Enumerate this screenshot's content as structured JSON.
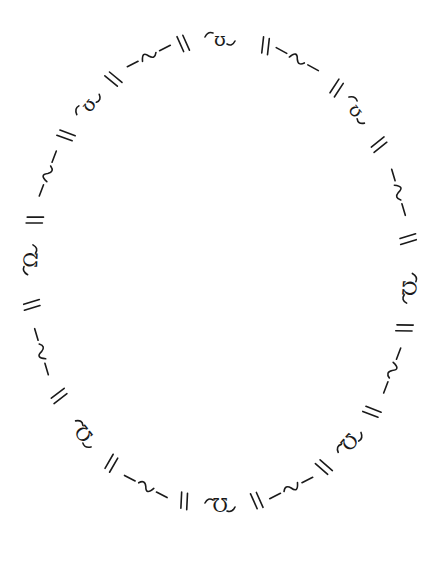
{
  "drawing": {
    "description": "Hand-drawn oval border made of repeating decorative motifs on white paper",
    "background": "#ffffff",
    "ink": "#1a1a1a",
    "ellipse": {
      "cx": 220,
      "cy": 272,
      "rx": 190,
      "ry": 233
    },
    "motif_sequence_clockwise_from_top": [
      {
        "angle": -90,
        "type": "glyph",
        "char": "ʊ"
      },
      {
        "angle": -76,
        "type": "double-slash"
      },
      {
        "angle": -66,
        "type": "wave"
      },
      {
        "angle": -52,
        "type": "double-slash"
      },
      {
        "angle": -44,
        "type": "glyph",
        "char": "ʊ"
      },
      {
        "angle": -33,
        "type": "double-slash"
      },
      {
        "angle": -20,
        "type": "wave"
      },
      {
        "angle": -8,
        "type": "double-slash"
      },
      {
        "angle": 4,
        "type": "glyph",
        "char": "Ω"
      },
      {
        "angle": 14,
        "type": "double-slash"
      },
      {
        "angle": 25,
        "type": "wave"
      },
      {
        "angle": 37,
        "type": "double-slash"
      },
      {
        "angle": 47,
        "type": "glyph",
        "char": "Ω"
      },
      {
        "angle": 57,
        "type": "double-slash"
      },
      {
        "angle": 68,
        "type": "wave"
      },
      {
        "angle": 79,
        "type": "double-slash"
      },
      {
        "angle": 90,
        "type": "glyph",
        "char": "Ω"
      },
      {
        "angle": 101,
        "type": "double-slash"
      },
      {
        "angle": 113,
        "type": "wave"
      },
      {
        "angle": 125,
        "type": "double-slash"
      },
      {
        "angle": 136,
        "type": "glyph",
        "char": "Ω"
      },
      {
        "angle": 148,
        "type": "double-slash"
      },
      {
        "angle": 160,
        "type": "wave"
      },
      {
        "angle": 172,
        "type": "double-slash"
      },
      {
        "angle": 183,
        "type": "glyph",
        "char": "Ω"
      },
      {
        "angle": 193,
        "type": "double-slash"
      },
      {
        "angle": 205,
        "type": "wave"
      },
      {
        "angle": 216,
        "type": "double-slash"
      },
      {
        "angle": 226,
        "type": "glyph",
        "char": "ʊ"
      },
      {
        "angle": 236,
        "type": "double-slash"
      },
      {
        "angle": 248,
        "type": "wave"
      },
      {
        "angle": 259,
        "type": "double-slash"
      }
    ]
  },
  "caption": "Decorative hand-drawn oval"
}
